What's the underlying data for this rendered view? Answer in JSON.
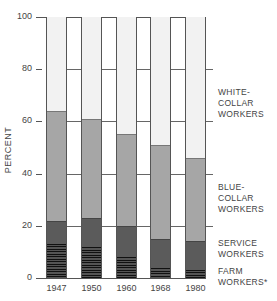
{
  "chart_data": {
    "type": "bar",
    "stacked": true,
    "title": "",
    "xlabel": "",
    "ylabel": "PERCENT",
    "ylim": [
      0,
      100
    ],
    "yticks": [
      "0",
      "20",
      "40",
      "60",
      "80",
      "100"
    ],
    "categories": [
      "1947",
      "1950",
      "1960",
      "1968",
      "1980"
    ],
    "series": [
      {
        "name": "FARM WORKERS*",
        "key": "farm",
        "values": [
          13,
          12,
          8,
          4,
          3
        ]
      },
      {
        "name": "SERVICE WORKERS",
        "key": "service",
        "values": [
          9,
          11,
          12,
          11,
          11
        ]
      },
      {
        "name": "BLUE-COLLAR WORKERS",
        "key": "blue",
        "values": [
          42,
          38,
          35,
          36,
          32
        ]
      },
      {
        "name": "WHITE-COLLAR WORKERS",
        "key": "white",
        "values": [
          36,
          39,
          45,
          49,
          54
        ]
      }
    ],
    "legend_position": "right",
    "grid": true
  },
  "labels": {
    "ylabel": "PERCENT",
    "white": [
      "WHITE-",
      "COLLAR",
      "WORKERS"
    ],
    "blue": [
      "BLUE-",
      "COLLAR",
      "WORKERS"
    ],
    "service": [
      "SERVICE",
      "WORKERS"
    ],
    "farm": [
      "FARM",
      "WORKERS*"
    ]
  }
}
